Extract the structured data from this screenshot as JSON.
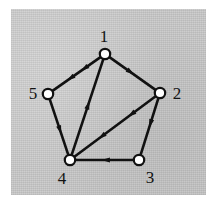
{
  "figure": {
    "kind": "directed-graph-diagram",
    "background_color": "#c9c9c9",
    "ink_color": "#111111",
    "node_fill_color": "#ffffff",
    "plate": {
      "x": 11,
      "y": 9,
      "width": 195,
      "height": 186
    }
  },
  "graph": {
    "node_radius": 5.2,
    "nodes": [
      {
        "id": "1",
        "label": "1",
        "cx": 105,
        "cy": 54,
        "label_x": 104,
        "label_y": 36
      },
      {
        "id": "2",
        "label": "2",
        "cx": 160,
        "cy": 93,
        "label_x": 177,
        "label_y": 93
      },
      {
        "id": "3",
        "label": "3",
        "cx": 139,
        "cy": 160,
        "label_x": 150,
        "label_y": 177
      },
      {
        "id": "4",
        "label": "4",
        "cx": 70,
        "cy": 160,
        "label_x": 62,
        "label_y": 178
      },
      {
        "id": "5",
        "label": "5",
        "cx": 48,
        "cy": 94,
        "label_x": 33,
        "label_y": 93
      }
    ],
    "edges": [
      {
        "id": "e-1-5",
        "from": "1",
        "to": "5",
        "arrow_positions": [
          0.34,
          0.62
        ],
        "label": "edge-1-to-5"
      },
      {
        "id": "e-1-2",
        "from": "1",
        "to": "2",
        "arrow_positions": [
          0.46
        ],
        "label": "edge-1-to-2"
      },
      {
        "id": "e-5-4",
        "from": "5",
        "to": "4",
        "arrow_positions": [
          0.55
        ],
        "label": "edge-5-to-4"
      },
      {
        "id": "e-2-3",
        "from": "2",
        "to": "3",
        "arrow_positions": [
          0.45
        ],
        "label": "edge-2-to-3"
      },
      {
        "id": "e-3-4",
        "from": "3",
        "to": "4",
        "arrow_positions": [
          0.48
        ],
        "label": "edge-3-to-4"
      },
      {
        "id": "e-4-1",
        "from": "4",
        "to": "1",
        "arrow_positions": [
          0.52
        ],
        "label": "edge-4-to-1"
      },
      {
        "id": "e-2-4",
        "from": "2",
        "to": "4",
        "arrow_positions": [
          0.3,
          0.66
        ],
        "label": "edge-2-to-4"
      }
    ],
    "edge_width": 2.6,
    "arrow_size": 8.5
  }
}
